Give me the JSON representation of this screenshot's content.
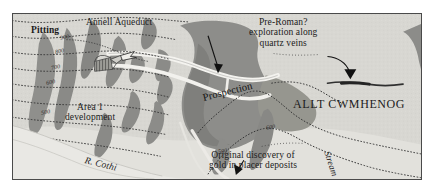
{
  "figure": {
    "kind": "archaeological-geology-map",
    "frame": {
      "x": 12,
      "y": 13,
      "width": 410,
      "height": 167
    },
    "background_color": "#d8d7d2",
    "frame_color": "#4a4a4a"
  },
  "palette": {
    "background": "#d8d7d2",
    "page": "#ffffff",
    "dark_unit": "#8d8d8a",
    "darker_unit": "#787874",
    "light_unit": "#e8e7e3",
    "aqueduct": "#f2f1ed",
    "river": "#efeeea",
    "contour": "#3a3a3a",
    "text": "#1b1b1b"
  },
  "labels": {
    "pitting": "Pitting",
    "annell_aqueduct": "Annell Aqueduct",
    "pre_roman": "Pre-Roman?\nexploration along\nquartz veins",
    "prospection": "Prospection",
    "allt_cwmhenog": "ALLT CWMHENOG",
    "area_1": "Area 1\ndevelopment",
    "river_cothi": "R. Cothi",
    "original_discovery": "Original discovery of\ngold in placer deposits",
    "stream": "Stream"
  },
  "contours": {
    "unit": "ft",
    "labels": [
      {
        "value": "900",
        "x": 47,
        "y": 20
      },
      {
        "value": "800",
        "x": 42,
        "y": 34
      },
      {
        "value": "700",
        "x": 38,
        "y": 50
      },
      {
        "value": "600",
        "x": 33,
        "y": 65
      },
      {
        "value": "500",
        "x": 28,
        "y": 95
      },
      {
        "value": "600",
        "x": 253,
        "y": 110
      },
      {
        "value": "500",
        "x": 205,
        "y": 134
      }
    ]
  },
  "annotations": [
    {
      "name": "annell-aqueduct-leader",
      "from_label": "annell_aqueduct",
      "points_to": "aqueduct-channel"
    },
    {
      "name": "pre-roman-leader",
      "from_label": "pre_roman",
      "points_to": "quartz-vein"
    },
    {
      "name": "original-discovery-leader",
      "from_label": "original_discovery",
      "points_to": "placer-deposit"
    },
    {
      "name": "pitting-leader",
      "from_label": "pitting",
      "points_to": "pitting-zone"
    }
  ]
}
